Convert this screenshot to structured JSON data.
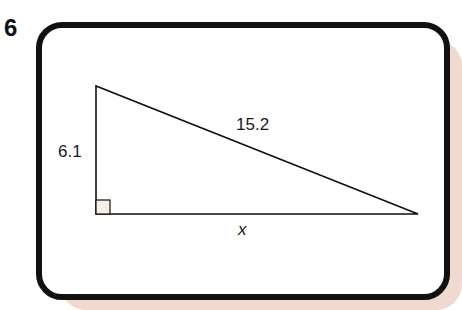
{
  "problem": {
    "number": "6"
  },
  "figure": {
    "type": "right-triangle",
    "vertices": {
      "top": [
        96,
        86
      ],
      "right_angle": [
        96,
        214
      ],
      "right": [
        418,
        214
      ]
    },
    "labels": {
      "vertical_leg": "6.1",
      "hypotenuse": "15.2",
      "horizontal_leg": "x"
    },
    "right_angle_marker": true
  },
  "colors": {
    "stroke": "#111111",
    "card_background": "#ffffff",
    "shadow": "#f1d9cf"
  }
}
